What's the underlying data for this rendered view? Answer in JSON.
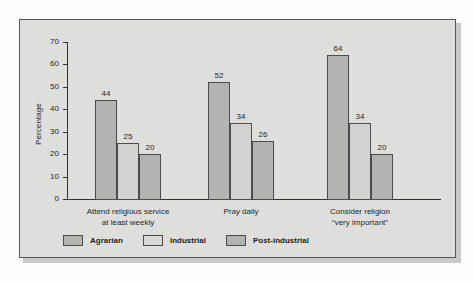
{
  "chart_data": {
    "type": "bar",
    "title": "",
    "xlabel": "",
    "ylabel": "Percentage",
    "ylim": [
      0,
      70
    ],
    "yticks": [
      0,
      10,
      20,
      30,
      40,
      50,
      60,
      70
    ],
    "grid": false,
    "legend_position": "bottom-left",
    "categories": [
      "Attend religious service\nat least weekly",
      "Pray daily",
      "Consider religion\n“very important”"
    ],
    "category_lines": [
      [
        "Attend religious service",
        "at least weekly"
      ],
      [
        "Pray daily",
        ""
      ],
      [
        "Consider religion",
        "“very important”"
      ]
    ],
    "series": [
      {
        "name": "Agrarian",
        "color": "#b3b3b1",
        "values": [
          44,
          52,
          64
        ]
      },
      {
        "name": "Industrial",
        "color": "#d3d3d1",
        "values": [
          25,
          34,
          34
        ]
      },
      {
        "name": "Post-industrial",
        "color": "#b3b3b1",
        "values": [
          20,
          26,
          20
        ]
      }
    ],
    "value_labels": [
      [
        "44",
        "25",
        "20"
      ],
      [
        "52",
        "34",
        "26"
      ],
      [
        "64",
        "34",
        "20"
      ]
    ],
    "ytick_labels": [
      "0",
      "10",
      "20",
      "30",
      "40",
      "50",
      "60",
      "70"
    ],
    "colors": {
      "panel_background": "#dededc",
      "panel_border": "#55565a",
      "axis": "#2f3134",
      "bar_outline": "#4a4c50",
      "text": "#25262a"
    }
  },
  "legend": {
    "items": [
      {
        "label": "Agrarian"
      },
      {
        "label": "Industrial"
      },
      {
        "label": "Post-industrial"
      }
    ]
  }
}
